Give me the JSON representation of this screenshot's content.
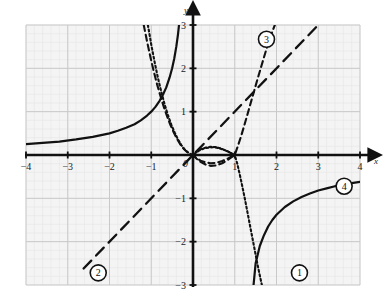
{
  "figure": {
    "kind": "coordinate-graph",
    "background_color": "#ffffff",
    "plot_background_color": "#f4f4f4",
    "minor_grid_color": "#e2e2e2",
    "major_grid_color": "#c9c9c9",
    "axis_color": "#111111",
    "curve_color": "#111111"
  },
  "axes": {
    "x_name": "x",
    "y_name": "y",
    "x_min": -4,
    "x_max": 4,
    "y_min": -3,
    "y_max": 3,
    "x_ticks": [
      {
        "value": -4,
        "label": "−4"
      },
      {
        "value": -3,
        "label": "−3"
      },
      {
        "value": -2,
        "label": "−2"
      },
      {
        "value": -1,
        "label": "−1"
      },
      {
        "value": 1,
        "label": "1"
      },
      {
        "value": 2,
        "label": "2"
      },
      {
        "value": 3,
        "label": "3"
      },
      {
        "value": 4,
        "label": "4"
      }
    ],
    "y_ticks": [
      {
        "value": 3,
        "label": "3"
      },
      {
        "value": 2,
        "label": "2"
      },
      {
        "value": 1,
        "label": "1"
      },
      {
        "value": -1,
        "label": "−1"
      },
      {
        "value": -2,
        "label": "−2"
      },
      {
        "value": -3,
        "label": "−3"
      }
    ],
    "origin_label": "0",
    "grid_minor_step": 0.2,
    "grid_major_step": 1
  },
  "curve_labels": [
    {
      "id": "1",
      "text": "1",
      "x": 2.55,
      "y": -2.72
    },
    {
      "id": "2",
      "text": "2",
      "x": -2.27,
      "y": -2.72
    },
    {
      "id": "3",
      "text": "3",
      "x": 1.76,
      "y": 2.67
    },
    {
      "id": "4",
      "text": "4",
      "x": 3.62,
      "y": -0.72
    }
  ],
  "chart_data": {
    "type": "line",
    "title": "",
    "xlabel": "x",
    "ylabel": "y",
    "xlim": [
      -4,
      4
    ],
    "ylim": [
      -3,
      3
    ],
    "grid": true,
    "legend": "inline-circled-numbers",
    "series": [
      {
        "name": "1",
        "style": "dotted",
        "description": "steeply descending curve through (1,0) and passing near (-1,3)",
        "points": [
          [
            -1.08,
            3.0
          ],
          [
            -1.0,
            2.55
          ],
          [
            -0.92,
            2.15
          ],
          [
            -0.84,
            1.78
          ],
          [
            -0.76,
            1.46
          ],
          [
            -0.68,
            1.17
          ],
          [
            -0.6,
            0.92
          ],
          [
            -0.52,
            0.7
          ],
          [
            -0.44,
            0.52
          ],
          [
            -0.36,
            0.36
          ],
          [
            -0.28,
            0.23
          ],
          [
            -0.2,
            0.13
          ],
          [
            -0.12,
            0.06
          ],
          [
            -0.06,
            0.02
          ],
          [
            0.0,
            0.0
          ],
          [
            0.08,
            0.06
          ],
          [
            0.16,
            0.11
          ],
          [
            0.26,
            0.15
          ],
          [
            0.38,
            0.17
          ],
          [
            0.5,
            0.18
          ],
          [
            0.62,
            0.16
          ],
          [
            0.74,
            0.12
          ],
          [
            0.86,
            0.07
          ],
          [
            0.95,
            0.02
          ],
          [
            1.0,
            0.0
          ],
          [
            1.06,
            -0.2
          ],
          [
            1.12,
            -0.45
          ],
          [
            1.18,
            -0.72
          ],
          [
            1.24,
            -1.0
          ],
          [
            1.3,
            -1.3
          ],
          [
            1.36,
            -1.6
          ],
          [
            1.42,
            -1.9
          ],
          [
            1.48,
            -2.2
          ],
          [
            1.54,
            -2.5
          ],
          [
            1.6,
            -2.78
          ],
          [
            1.65,
            -3.0
          ]
        ]
      },
      {
        "name": "2",
        "style": "long-dash",
        "description": "straight line y = x through the origin",
        "points": [
          [
            -2.62,
            -2.62
          ],
          [
            0,
            0
          ],
          [
            3.0,
            3.0
          ]
        ]
      },
      {
        "name": "3",
        "style": "dash",
        "description": "steeply rising curve from (1,0) upward to the right; descending branch left of origin",
        "points": [
          [
            -1.18,
            3.0
          ],
          [
            -1.1,
            2.62
          ],
          [
            -1.02,
            2.26
          ],
          [
            -0.94,
            1.93
          ],
          [
            -0.86,
            1.63
          ],
          [
            -0.78,
            1.36
          ],
          [
            -0.7,
            1.11
          ],
          [
            -0.62,
            0.89
          ],
          [
            -0.54,
            0.69
          ],
          [
            -0.46,
            0.52
          ],
          [
            -0.38,
            0.37
          ],
          [
            -0.3,
            0.24
          ],
          [
            -0.22,
            0.14
          ],
          [
            -0.14,
            0.07
          ],
          [
            -0.06,
            0.02
          ],
          [
            0.0,
            0.0
          ],
          [
            0.08,
            -0.07
          ],
          [
            0.18,
            -0.13
          ],
          [
            0.3,
            -0.17
          ],
          [
            0.42,
            -0.19
          ],
          [
            0.56,
            -0.18
          ],
          [
            0.7,
            -0.14
          ],
          [
            0.84,
            -0.08
          ],
          [
            0.94,
            -0.03
          ],
          [
            1.0,
            0.0
          ],
          [
            1.08,
            0.22
          ],
          [
            1.16,
            0.46
          ],
          [
            1.24,
            0.72
          ],
          [
            1.32,
            0.99
          ],
          [
            1.4,
            1.26
          ],
          [
            1.48,
            1.53
          ],
          [
            1.56,
            1.8
          ],
          [
            1.64,
            2.06
          ],
          [
            1.72,
            2.32
          ],
          [
            1.8,
            2.57
          ],
          [
            1.88,
            2.8
          ],
          [
            1.96,
            3.0
          ]
        ]
      },
      {
        "name": "4",
        "style": "solid",
        "description": "hyperbola y = -1/x with branches in quadrant II and quadrant IV",
        "branches": [
          [
            [
              -4.0,
              0.25
            ],
            [
              -3.6,
              0.28
            ],
            [
              -3.2,
              0.31
            ],
            [
              -2.8,
              0.36
            ],
            [
              -2.4,
              0.42
            ],
            [
              -2.0,
              0.5
            ],
            [
              -1.8,
              0.56
            ],
            [
              -1.6,
              0.63
            ],
            [
              -1.4,
              0.71
            ],
            [
              -1.25,
              0.8
            ],
            [
              -1.1,
              0.91
            ],
            [
              -1.0,
              1.0
            ],
            [
              -0.9,
              1.11
            ],
            [
              -0.8,
              1.25
            ],
            [
              -0.72,
              1.39
            ],
            [
              -0.64,
              1.56
            ],
            [
              -0.56,
              1.79
            ],
            [
              -0.5,
              2.0
            ],
            [
              -0.45,
              2.22
            ],
            [
              -0.4,
              2.5
            ],
            [
              -0.36,
              2.78
            ],
            [
              -0.335,
              3.0
            ]
          ],
          [
            [
              1.45,
              -3.0
            ],
            [
              1.5,
              -2.5
            ],
            [
              1.6,
              -2.1
            ],
            [
              1.7,
              -1.85
            ],
            [
              1.8,
              -1.65
            ],
            [
              1.9,
              -1.5
            ],
            [
              2.0,
              -1.38
            ],
            [
              2.2,
              -1.2
            ],
            [
              2.4,
              -1.07
            ],
            [
              2.6,
              -0.97
            ],
            [
              2.8,
              -0.89
            ],
            [
              3.0,
              -0.82
            ],
            [
              3.2,
              -0.77
            ],
            [
              3.4,
              -0.72
            ],
            [
              3.6,
              -0.68
            ],
            [
              3.8,
              -0.65
            ],
            [
              4.0,
              -0.62
            ]
          ]
        ]
      },
      {
        "name": "loop",
        "style": "dash-dot-mixed",
        "description": "closed loop between (0,0) and (1,0), dotted upper arc and dashed lower arc",
        "upper_arc": [
          [
            0.0,
            0.0
          ],
          [
            0.08,
            0.07
          ],
          [
            0.18,
            0.13
          ],
          [
            0.3,
            0.17
          ],
          [
            0.42,
            0.19
          ],
          [
            0.56,
            0.18
          ],
          [
            0.7,
            0.14
          ],
          [
            0.84,
            0.08
          ],
          [
            0.94,
            0.03
          ],
          [
            1.0,
            0.0
          ]
        ],
        "lower_arc": [
          [
            0.0,
            0.0
          ],
          [
            0.08,
            -0.08
          ],
          [
            0.18,
            -0.16
          ],
          [
            0.3,
            -0.22
          ],
          [
            0.42,
            -0.25
          ],
          [
            0.56,
            -0.24
          ],
          [
            0.7,
            -0.19
          ],
          [
            0.84,
            -0.11
          ],
          [
            0.94,
            -0.04
          ],
          [
            1.0,
            0.0
          ]
        ]
      }
    ]
  }
}
